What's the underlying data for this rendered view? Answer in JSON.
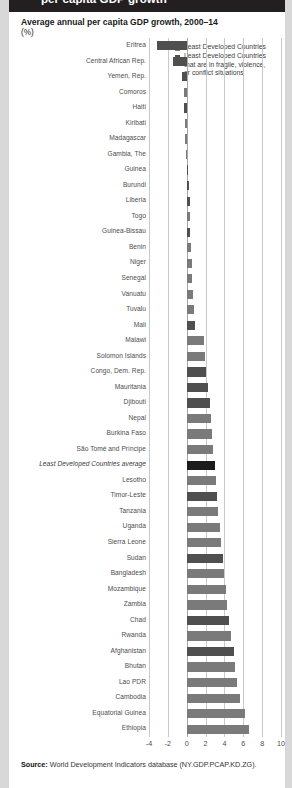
{
  "banner": {
    "text": "per capita GDP growth"
  },
  "chart_data": {
    "type": "bar",
    "orientation": "horizontal",
    "title": "Average annual per capita GDP growth, 2000–14",
    "subtitle": "(%)",
    "xlabel": "",
    "ylabel": "",
    "xlim": [
      -4,
      10
    ],
    "xticks": [
      "-4",
      "-2",
      "0",
      "2",
      "4",
      "6",
      "8",
      "10"
    ],
    "grid": true,
    "legend_position": "top-right",
    "legend": [
      {
        "label": "Least Developed Countries",
        "color": "#7a7a7a",
        "key": "ldc"
      },
      {
        "label": "Least Developed Countries that are in fragile, violence, or conflict situations",
        "color": "#4f4f4f",
        "key": "fragile"
      }
    ],
    "legend_lines": [
      [
        "Least Developed Countries"
      ],
      [
        "Least Developed Countries",
        "that are in fragile, violence,",
        "or conflict situations"
      ]
    ],
    "categories": [
      "Eritrea",
      "Central African Rep.",
      "Yemen, Rep.",
      "Comoros",
      "Haiti",
      "Kiribati",
      "Madagascar",
      "Gambia, The",
      "Guinea",
      "Burundi",
      "Liberia",
      "Togo",
      "Guinea-Bissau",
      "Benin",
      "Niger",
      "Senegal",
      "Vanuatu",
      "Tuvalu",
      "Mali",
      "Malawi",
      "Solomon Islands",
      "Congo, Dem. Rep.",
      "Mauritania",
      "Djibouti",
      "Nepal",
      "Burkina Faso",
      "São Tomé and Príncipe",
      "Least Developed Countries average",
      "Lesotho",
      "Timor-Leste",
      "Tanzania",
      "Uganda",
      "Sierra Leone",
      "Sudan",
      "Bangladesh",
      "Mozambique",
      "Zambia",
      "Chad",
      "Rwanda",
      "Afghanistan",
      "Bhutan",
      "Lao PDR",
      "Cambodia",
      "Equatorial Guinea",
      "Ethiopia"
    ],
    "values": [
      -3.1,
      -1.5,
      -0.45,
      -0.3,
      -0.25,
      -0.2,
      -0.15,
      -0.1,
      0.1,
      0.2,
      0.3,
      0.35,
      0.4,
      0.5,
      0.55,
      0.6,
      0.7,
      0.8,
      0.9,
      1.85,
      1.9,
      2.0,
      2.3,
      2.5,
      2.6,
      2.7,
      2.8,
      3.0,
      3.1,
      3.2,
      3.3,
      3.5,
      3.6,
      3.9,
      4.0,
      4.2,
      4.3,
      4.5,
      4.7,
      5.0,
      5.1,
      5.3,
      5.6,
      6.2,
      6.6
    ],
    "series_keys": [
      "fragile",
      "fragile",
      "fragile",
      "ldc",
      "fragile",
      "ldc",
      "ldc",
      "ldc",
      "fragile",
      "fragile",
      "fragile",
      "ldc",
      "fragile",
      "ldc",
      "ldc",
      "ldc",
      "ldc",
      "ldc",
      "fragile",
      "ldc",
      "ldc",
      "fragile",
      "fragile",
      "fragile",
      "ldc",
      "ldc",
      "ldc",
      "avg",
      "ldc",
      "fragile",
      "ldc",
      "ldc",
      "ldc",
      "fragile",
      "ldc",
      "ldc",
      "ldc",
      "fragile",
      "ldc",
      "fragile",
      "ldc",
      "ldc",
      "ldc",
      "ldc",
      "ldc"
    ]
  },
  "source": {
    "label": "Source:",
    "text": " World Development Indicators database (NY.GDP.PCAP.KD.ZG)."
  }
}
